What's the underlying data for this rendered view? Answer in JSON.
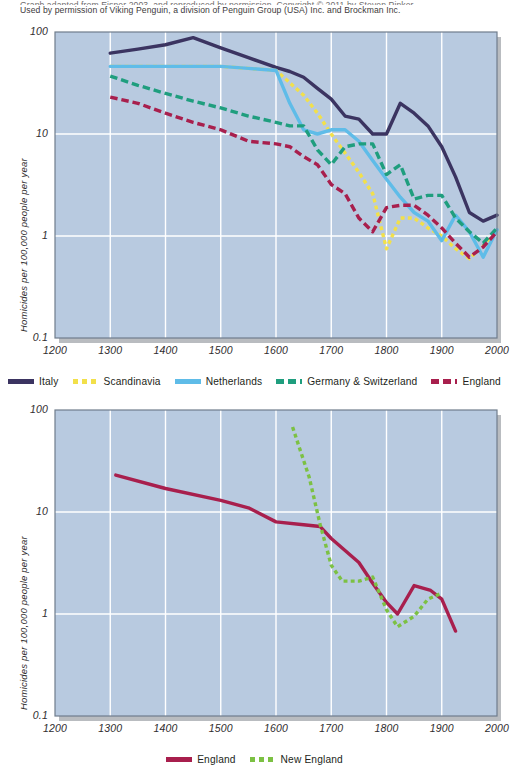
{
  "caption": {
    "line_top_clipped": "Graph adapted from Eisner 2003, and reproduced by permission. Copyright © 2011 by Steven Pinker.",
    "line_permission": "Used by permission of Viking Penguin, a division of Penguin Group (USA) Inc. and Brockman Inc."
  },
  "colors": {
    "plot_background": "#b8cae0",
    "gridline": "#ffffff",
    "plot_border": "#6f7c8c",
    "plot_shadow": "#b9bcc0",
    "italy": "#3b3461",
    "scandinavia": "#f2e04a",
    "netherlands": "#5fbce8",
    "germany_switzerland": "#1f9e7e",
    "england": "#a81f4d",
    "new_england": "#7cc143",
    "text": "#231f20"
  },
  "figures": [
    {
      "id": "figure-1",
      "axes": {
        "y_label": "Homicides per 100,000 people per year",
        "y_ticks": [
          "100",
          "10",
          "1",
          "0.1"
        ],
        "x_ticks": [
          "1200",
          "1300",
          "1400",
          "1500",
          "1600",
          "1700",
          "1800",
          "1900",
          "2000"
        ]
      },
      "legend": [
        {
          "label": "Italy",
          "color_key": "italy",
          "style": "solid"
        },
        {
          "label": "Scandinavia",
          "color_key": "scandinavia",
          "style": "dotted"
        },
        {
          "label": "Netherlands",
          "color_key": "netherlands",
          "style": "solid"
        },
        {
          "label": "Germany & Switzerland",
          "color_key": "germany_switzerland",
          "style": "dashed"
        },
        {
          "label": "England",
          "color_key": "england",
          "style": "dashed"
        }
      ]
    },
    {
      "id": "figure-2",
      "axes": {
        "y_label": "Homicides per 100,000 people per year",
        "y_ticks": [
          "100",
          "10",
          "1",
          "0.1"
        ],
        "x_ticks": [
          "1200",
          "1300",
          "1400",
          "1500",
          "1600",
          "1700",
          "1800",
          "1900",
          "2000"
        ]
      },
      "legend": [
        {
          "label": "England",
          "color_key": "england",
          "style": "solid"
        },
        {
          "label": "New England",
          "color_key": "new_england",
          "style": "dotted"
        }
      ]
    }
  ],
  "chart_data": [
    {
      "type": "line",
      "title": "",
      "xlabel": "",
      "ylabel": "Homicides per 100,000 people per year",
      "yscale": "log",
      "ylim": [
        0.1,
        100
      ],
      "xlim": [
        1200,
        2000
      ],
      "grid": true,
      "legend_position": "below",
      "series": [
        {
          "name": "Italy",
          "color": "#3b3461",
          "style": "solid",
          "x": [
            1300,
            1350,
            1400,
            1450,
            1500,
            1550,
            1600,
            1625,
            1650,
            1675,
            1700,
            1725,
            1750,
            1775,
            1800,
            1825,
            1850,
            1875,
            1900,
            1925,
            1950,
            1975,
            2000
          ],
          "y": [
            62,
            68,
            75,
            88,
            70,
            56,
            45,
            41,
            36,
            28,
            22,
            15,
            14,
            10,
            10,
            20,
            16,
            12,
            7.5,
            3.8,
            1.7,
            1.4,
            1.6
          ]
        },
        {
          "name": "Scandinavia",
          "color": "#f2e04a",
          "style": "dotted",
          "x": [
            1300,
            1350,
            1400,
            1450,
            1500,
            1550,
            1600,
            1650,
            1675,
            1700,
            1725,
            1750,
            1775,
            1800,
            1825,
            1850,
            1875,
            1900,
            1925,
            1950,
            1975,
            2000
          ],
          "y": [
            46,
            46,
            46,
            46,
            46,
            44,
            42,
            24,
            16,
            10,
            6.5,
            4.2,
            2.6,
            0.75,
            1.5,
            1.5,
            1.2,
            1.0,
            0.75,
            0.6,
            0.8,
            1.1
          ]
        },
        {
          "name": "Netherlands",
          "color": "#5fbce8",
          "style": "solid",
          "x": [
            1300,
            1350,
            1400,
            1450,
            1500,
            1550,
            1600,
            1625,
            1650,
            1675,
            1700,
            1725,
            1750,
            1775,
            1800,
            1825,
            1850,
            1875,
            1900,
            1925,
            1950,
            1975,
            2000
          ],
          "y": [
            46,
            46,
            46,
            46,
            46,
            44,
            42,
            20,
            11,
            10,
            11,
            11,
            8.5,
            5.5,
            3.6,
            2.4,
            1.7,
            1.4,
            0.9,
            1.6,
            1.1,
            0.62,
            1.15
          ]
        },
        {
          "name": "Germany & Switzerland",
          "color": "#1f9e7e",
          "style": "dashed",
          "x": [
            1300,
            1350,
            1400,
            1450,
            1500,
            1550,
            1600,
            1625,
            1650,
            1675,
            1700,
            1725,
            1750,
            1775,
            1800,
            1825,
            1850,
            1875,
            1900,
            1925,
            1950,
            1975,
            2000
          ],
          "y": [
            37,
            30,
            25,
            21,
            18,
            15,
            13,
            12,
            12,
            7.0,
            5.0,
            7.5,
            8.0,
            8.0,
            4.0,
            5.0,
            2.3,
            2.5,
            2.5,
            1.5,
            1.1,
            0.85,
            1.2
          ]
        },
        {
          "name": "England",
          "color": "#a81f4d",
          "style": "dashed",
          "x": [
            1300,
            1350,
            1400,
            1450,
            1500,
            1550,
            1600,
            1625,
            1650,
            1675,
            1700,
            1725,
            1750,
            1775,
            1800,
            1825,
            1850,
            1875,
            1900,
            1925,
            1950,
            1975,
            2000
          ],
          "y": [
            23,
            20,
            16,
            13,
            11,
            8.5,
            8.0,
            7.5,
            6.0,
            5.0,
            3.2,
            2.6,
            1.5,
            1.1,
            1.9,
            2.0,
            2.0,
            1.6,
            1.2,
            0.85,
            0.62,
            0.78,
            1.1
          ]
        }
      ]
    },
    {
      "type": "line",
      "title": "",
      "xlabel": "",
      "ylabel": "Homicides per 100,000 people per year",
      "yscale": "log",
      "ylim": [
        0.1,
        100
      ],
      "xlim": [
        1200,
        2000
      ],
      "grid": true,
      "legend_position": "below",
      "series": [
        {
          "name": "England",
          "color": "#a81f4d",
          "style": "solid",
          "x": [
            1310,
            1400,
            1500,
            1550,
            1600,
            1650,
            1680,
            1700,
            1750,
            1775,
            1800,
            1820,
            1850,
            1880,
            1900,
            1925
          ],
          "y": [
            23,
            17,
            13,
            11,
            8.0,
            7.5,
            7.2,
            5.5,
            3.2,
            2.0,
            1.3,
            1.0,
            1.9,
            1.7,
            1.4,
            0.68
          ]
        },
        {
          "name": "New England",
          "color": "#7cc143",
          "style": "dotted",
          "x": [
            1630,
            1660,
            1680,
            1700,
            1720,
            1750,
            1775,
            1800,
            1820,
            1850,
            1875,
            1900
          ],
          "y": [
            68,
            22,
            7.5,
            3.0,
            2.1,
            2.1,
            2.3,
            1.1,
            0.75,
            0.95,
            1.4,
            1.6
          ]
        }
      ]
    }
  ]
}
